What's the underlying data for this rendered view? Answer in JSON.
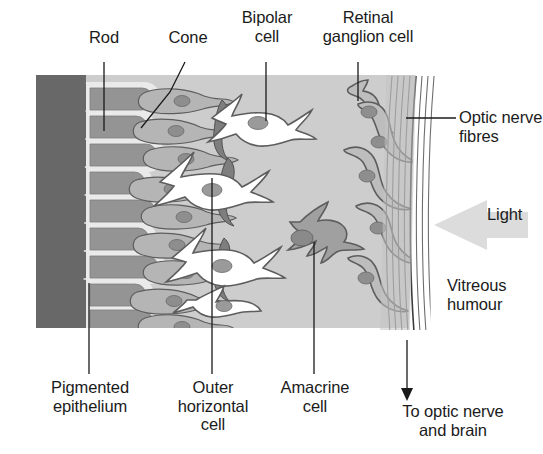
{
  "figure": {
    "type": "anatomical-cross-section",
    "caption_partial": ""
  },
  "colors": {
    "page_background": "#ffffff",
    "retina_background": "#cdcdcd",
    "pigmented_epithelium": "#686868",
    "photoreceptor_body": "#949494",
    "photoreceptor_outline": "#e6e6e6",
    "bipolar_cell_fill": "#ffffff",
    "bipolar_cell_outline": "#5d5d5d",
    "ganglion_cell_fill": "#b9b9b9",
    "ganglion_cell_outline": "#5d5d5d",
    "amacrine_cell_fill": "#a0a0a0",
    "horizontal_cell_fill": "#8a8a8a",
    "nucleus_fill": "#8e8e8e",
    "nerve_fibre_line": "#6b6b6b",
    "light_arrow": "#dcdcdc",
    "leader_line": "#1a1a1a",
    "text": "#1b1b1b"
  },
  "labels": {
    "rod": "Rod",
    "cone": "Cone",
    "bipolar_cell": "Bipolar\ncell",
    "retinal_ganglion_cell": "Retinal\nganglion cell",
    "optic_nerve_fibres": "Optic nerve\nfibres",
    "light": "Light",
    "vitreous_humour": "Vitreous\nhumour",
    "pigmented_epithelium": "Pigmented\nepithelium",
    "outer_horizontal_cell": "Outer\nhorizontal\ncell",
    "amacrine_cell": "Amacrine\ncell",
    "to_optic_nerve_and_brain": "To optic nerve\nand brain"
  },
  "structures": [
    {
      "name": "pigmented-epithelium",
      "side": "left",
      "description": "dark grey band with finger-like projections"
    },
    {
      "name": "rod-photoreceptors",
      "count": 9,
      "description": "elongated grey capsules"
    },
    {
      "name": "cone-photoreceptors",
      "count": 4,
      "description": "tapered grey capsules"
    },
    {
      "name": "outer-horizontal-cells",
      "description": "dark grey lateral cells at outer plexiform layer"
    },
    {
      "name": "bipolar-cells",
      "count": 4,
      "description": "white cells with grey nuclei"
    },
    {
      "name": "amacrine-cell",
      "count": 1,
      "description": "mid-grey branched cell"
    },
    {
      "name": "retinal-ganglion-cells",
      "count": 5,
      "description": "grey cells whose axons form the nerve fibre layer"
    },
    {
      "name": "optic-nerve-fibre-layer",
      "side": "right",
      "description": "curved parallel striations"
    },
    {
      "name": "vitreous-humour",
      "side": "right",
      "description": "white region right of retina"
    }
  ],
  "light_direction": "right-to-left",
  "signal_direction": "downward to optic nerve and brain"
}
